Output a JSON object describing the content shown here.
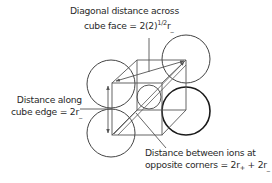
{
  "diagram": {
    "labels": {
      "face_diagonal": {
        "line1": "Diagonal distance across",
        "line2_prefix": "cube face = 2(2)",
        "line2_sup": "1/2",
        "line2_r": "r",
        "line2_sub": "_"
      },
      "edge": {
        "line1": "Distance along",
        "line2_prefix": "cube edge = 2r",
        "line2_sub": "_"
      },
      "corners": {
        "line1": "Distance between ions at",
        "line2_prefix": "opposite corners = 2r",
        "line2_sub1": "+",
        "line2_mid": " + 2r",
        "line2_sub2": "_"
      }
    },
    "shapes": {
      "cube": {
        "front_top_left": [
          112,
          83
        ],
        "front_top_right": [
          162,
          83
        ],
        "front_bottom_left": [
          112,
          135
        ],
        "front_bottom_right": [
          162,
          135
        ],
        "back_top_left": [
          137,
          60
        ],
        "back_top_right": [
          186,
          60
        ],
        "back_bottom_left": [
          137,
          110
        ],
        "back_bottom_right": [
          186,
          110
        ]
      },
      "anions": [
        {
          "name": "top-left",
          "cx": 111,
          "cy": 84,
          "r": 24
        },
        {
          "name": "bottom-left",
          "cx": 111,
          "cy": 133,
          "r": 24
        },
        {
          "name": "top-right",
          "cx": 186,
          "cy": 59,
          "r": 24
        },
        {
          "name": "right-bold",
          "cx": 186,
          "cy": 111,
          "r": 24
        }
      ],
      "cation": {
        "cx": 149,
        "cy": 97,
        "r": 12
      },
      "colors": {
        "line": "#555555",
        "circle": "#444444",
        "bold_circle": "#1a1a1a",
        "text": "#2a2a2a"
      }
    }
  }
}
